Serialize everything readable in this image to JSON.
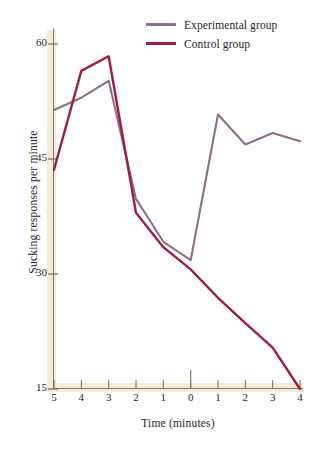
{
  "chart_data": {
    "type": "line",
    "title": "",
    "xlabel": "Time (minutes)",
    "ylabel": "Sucking responses per minute",
    "x": [
      -5,
      -4,
      -3,
      -2,
      -1,
      0,
      1,
      2,
      3,
      4
    ],
    "xtick_labels": [
      "5",
      "4",
      "3",
      "2",
      "1",
      "0",
      "1",
      "2",
      "3",
      "4"
    ],
    "ytick_labels": [
      "15",
      "30",
      "45",
      "60"
    ],
    "yticks": [
      15,
      30,
      45,
      60
    ],
    "ylim": [
      15,
      60
    ],
    "xlim": [
      -5,
      4
    ],
    "grid": false,
    "legend_position": "top-right",
    "zero_marker": true,
    "series": [
      {
        "name": "Experimental group",
        "color": "#8d7089",
        "values": [
          51.4,
          53.0,
          55.2,
          39.8,
          34.2,
          31.8,
          50.8,
          46.9,
          48.4,
          47.3
        ]
      },
      {
        "name": "Control group",
        "color": "#9e1f3d",
        "values": [
          43.6,
          56.5,
          58.4,
          38.0,
          33.5,
          30.6,
          26.9,
          23.6,
          20.4,
          15.0
        ]
      }
    ]
  },
  "legend": {
    "items": [
      {
        "label": "Experimental group",
        "color": "#8d7089"
      },
      {
        "label": "Control group",
        "color": "#9e1f3d"
      }
    ]
  },
  "axes": {
    "x_title": "Time (minutes)",
    "y_title": "Sucking responses per minute"
  },
  "colors": {
    "experimental": "#8d7089",
    "control": "#9e1f3d",
    "axis_band": "#f3ecd4",
    "axis_line": "#8a8578",
    "background": "#ffffff"
  }
}
